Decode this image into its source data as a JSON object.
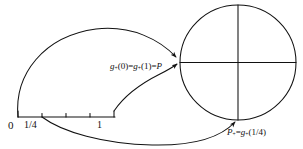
{
  "figure": {
    "kind": "hand-drawn-mathematical-diagram",
    "ink_color": "#111111",
    "background_color": "#ffffff"
  },
  "number_line": {
    "name": "unit-interval",
    "tick_labels": {
      "origin": "0",
      "quarter": "1/4",
      "one": "1"
    },
    "tick_values": [
      0,
      0.25,
      0.5,
      0.75,
      1
    ]
  },
  "circle": {
    "name": "target-circle",
    "center_label": "",
    "has_vertical_diameter": true,
    "has_horizontal_diameter": true
  },
  "labels": {
    "g_map": {
      "prefix": "g",
      "sub1": "+",
      "mid": "(0)=",
      "prefix2": "g",
      "sub2": "+",
      "tail": "(1)=",
      "point": "P"
    },
    "p_plus": {
      "point": "P",
      "sub_point": "+",
      "equals": "=",
      "fn": "g",
      "sub_fn": "+",
      "arg": "(1/4)"
    }
  },
  "arrows": [
    {
      "name": "upper-loop-arrow",
      "from": "0",
      "to": "P"
    },
    {
      "name": "mid-loop-arrow",
      "from": "1",
      "to": "P"
    },
    {
      "name": "lower-loop-arrow",
      "from": "1/4",
      "to": "P-plus"
    }
  ]
}
